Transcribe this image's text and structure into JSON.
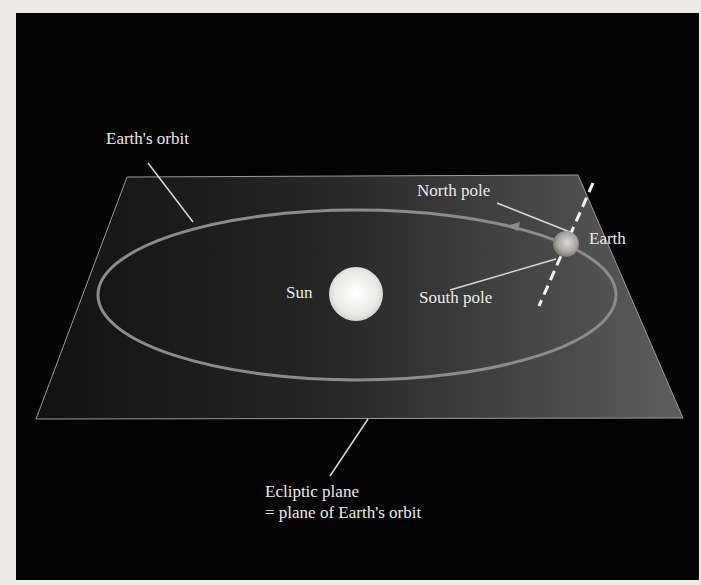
{
  "diagram": {
    "labels": {
      "earths_orbit": "Earth's orbit",
      "north_pole": "North pole",
      "earth": "Earth",
      "sun": "Sun",
      "south_pole": "South pole",
      "ecliptic_line1": "Ecliptic plane",
      "ecliptic_line2": "= plane of Earth's orbit"
    },
    "colors": {
      "background": "#030303",
      "plane_left": "#141414",
      "plane_right": "#5a5a5a",
      "plane_edge": "#9a9a9a",
      "orbit": "#8c8c8c",
      "leader_lines": "#d8d8d8",
      "sun": "#f4f4f0",
      "earth": "#b8b8b0",
      "text": "#ecebe6"
    }
  }
}
